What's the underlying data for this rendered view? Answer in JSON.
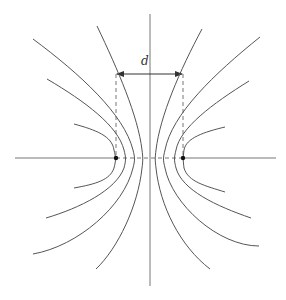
{
  "diagram": {
    "type": "field-lines-two-charges",
    "label_d": "d",
    "colors": {
      "line": "#555555",
      "axis": "#777777",
      "dashed": "#777777",
      "charge": "#111111",
      "background": "#ffffff"
    },
    "axes": {
      "horizontal": {
        "x1": 15,
        "x2": 276,
        "y": 158
      },
      "vertical": {
        "x": 150,
        "y1": 14,
        "y2": 286
      }
    },
    "charges": [
      {
        "name": "left-charge",
        "x": 116,
        "y": 158
      },
      {
        "name": "right-charge",
        "x": 183,
        "y": 158
      }
    ],
    "dimension_arrow": {
      "x1": 116,
      "x2": 183,
      "y": 74,
      "label_x": 144,
      "label_y": 66
    }
  }
}
